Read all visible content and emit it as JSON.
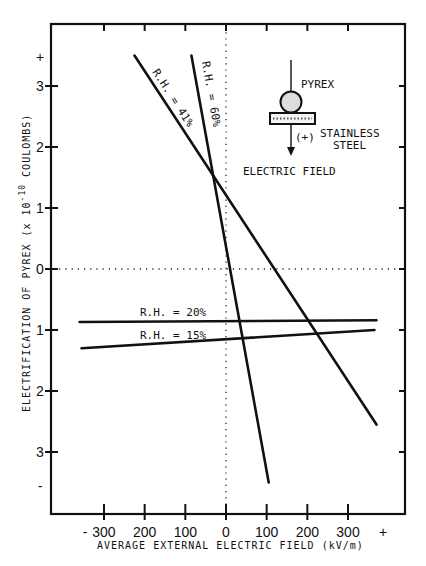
{
  "chart_data": {
    "type": "line",
    "title": "",
    "xlabel": "AVERAGE EXTERNAL ELECTRIC FIELD (kV/m)",
    "ylabel": "ELECTRIFICATION OF PYREX (x 10^-10 COULOMBS)",
    "ylabel_parts": {
      "main": "ELECTRIFICATION OF PYREX (x 10",
      "exp": "-10",
      "tail": " COULOMBS)"
    },
    "x_tick_labels": [
      "-",
      "300",
      "200",
      "100",
      "0",
      "100",
      "200",
      "300",
      "+"
    ],
    "x_tick_values": [
      -300,
      -200,
      -100,
      0,
      100,
      200,
      300
    ],
    "y_tick_labels": [
      "+",
      "3",
      "2",
      "1",
      "0",
      "1",
      "2",
      "3",
      "-"
    ],
    "y_tick_values": [
      3,
      2,
      1,
      0,
      -1,
      -2,
      -3
    ],
    "xlim": [
      -360,
      360
    ],
    "ylim": [
      -3.9,
      3.9
    ],
    "grid": false,
    "reference_lines": [
      "x=0 dotted",
      "y=0 dotted"
    ],
    "series": [
      {
        "name": "R.H. = 41%",
        "label": "R.H. = 41%",
        "x": [
          -225,
          370
        ],
        "y": [
          3.5,
          -2.55
        ]
      },
      {
        "name": "R.H. = 60%",
        "label": "R.H. = 60%",
        "x": [
          -85,
          105
        ],
        "y": [
          3.5,
          -3.5
        ]
      },
      {
        "name": "R.H. = 20%",
        "label": "R.H. = 20%",
        "x": [
          -360,
          370
        ],
        "y": [
          -0.87,
          -0.84
        ]
      },
      {
        "name": "R.H. = 15%",
        "label": "R.H. = 15%",
        "x": [
          -355,
          365
        ],
        "y": [
          -1.3,
          -1.0
        ]
      }
    ],
    "annotations": {
      "inset": {
        "pyrex": "PYREX",
        "steel_line1": "STAINLESS",
        "steel_line2": "STEEL",
        "polarity": "(+)"
      },
      "field_label": "ELECTRIC FIELD"
    }
  },
  "icons": {
    "sphere": "pyrex-sphere-icon",
    "plate": "stainless-steel-plate-icon",
    "arrow": "electric-field-arrow-icon"
  }
}
